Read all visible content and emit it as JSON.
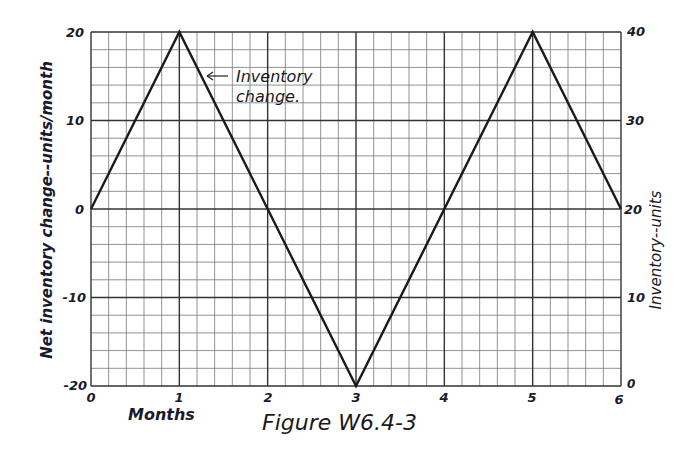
{
  "chart_data": {
    "type": "line",
    "title": "Figure W6.4-3",
    "xlabel": "Months",
    "ylabel_left": "Net inventory change--units/month",
    "ylabel_right": "Inventory--units",
    "x_ticks": [
      "0",
      "1",
      "2",
      "3",
      "4",
      "5",
      "6"
    ],
    "y_ticks_left": [
      "20",
      "10",
      "0",
      "-10",
      "-20"
    ],
    "y_ticks_right": [
      "40",
      "30",
      "20",
      "10",
      "0"
    ],
    "xlim": [
      0,
      6
    ],
    "ylim_left": [
      -20,
      20
    ],
    "ylim_right": [
      0,
      40
    ],
    "grid": true,
    "grid_minor_x_per_unit": 5,
    "grid_minor_y_step": 2,
    "series": [
      {
        "name": "Inventory change",
        "x": [
          0,
          1,
          3,
          5,
          6
        ],
        "values": [
          0,
          20,
          -20,
          20,
          0
        ]
      }
    ],
    "annotations": [
      {
        "text_line1": "Inventory",
        "text_line2": "change.",
        "points_to": [
          1.2,
          16
        ]
      }
    ]
  }
}
